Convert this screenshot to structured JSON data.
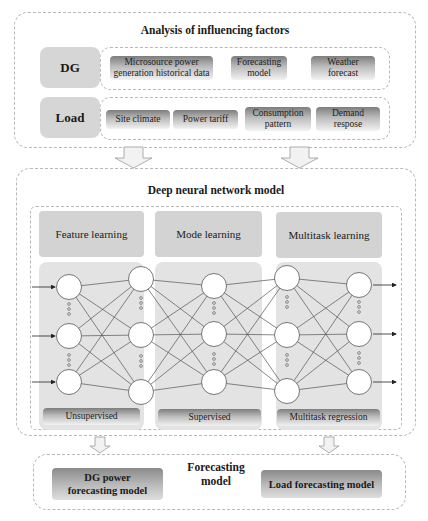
{
  "influencing_factors": {
    "title": "Analysis of influencing factors",
    "dg": {
      "label": "DG",
      "items": [
        "Microsource power generation historical data",
        "Forecasting model",
        "Weather forecast"
      ]
    },
    "load": {
      "label": "Load",
      "items": [
        "Site climate",
        "Power tariff",
        "Consumption pattern",
        "Demand respose"
      ]
    }
  },
  "dnn": {
    "title": "Deep neural network model",
    "stages": [
      {
        "header": "Feature learning",
        "footer": "Unsupervised"
      },
      {
        "header": "Mode learning",
        "footer": "Supervised"
      },
      {
        "header": "Multitask learning",
        "footer": "Multitask regression"
      }
    ],
    "network": {
      "layers": 5,
      "nodes_per_layer_shown": 3,
      "inputs": 3,
      "outputs": 3
    }
  },
  "forecasting": {
    "title": "Forecasting model",
    "dg_model": "DG power forecasting model",
    "load_model": "Load forecasting model"
  },
  "colors": {
    "panel_grey": "#d6d6d6",
    "gradient_dark": "#7d7d7d",
    "gradient_light": "#f2f2f2",
    "dash_border": "#b8b8b8"
  }
}
